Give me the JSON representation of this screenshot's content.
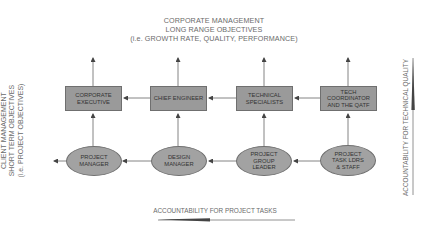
{
  "top": {
    "lines": [
      "CORPORATE MANAGEMENT",
      "LONG RANGE OBJECTIVES",
      "(i.e. GROWTH RATE, QUALITY, PERFORMANCE)"
    ]
  },
  "left": {
    "lines": [
      "CLIENT MANAGEMENT",
      "SHORT TERM OBJECTIVES",
      "(i.e. PROJECT OBJECTIVES)"
    ]
  },
  "right": {
    "label": "ACCOUNTABILITY FOR TECHNICAL QUALITY"
  },
  "bottom": {
    "label": "ACCOUNTABILITY FOR PROJECT TASKS"
  },
  "boxes": [
    {
      "label": "CORPORATE\nEXECUTIVE"
    },
    {
      "label": "CHIEF ENGINEER"
    },
    {
      "label": "TECHNICAL\nSPECIALISTS"
    },
    {
      "label": "TECH\nCOORDINATOR\nAND THE QATF"
    }
  ],
  "ellipses": [
    {
      "label": "PROJECT\nMANAGER"
    },
    {
      "label": "DESIGN\nMANAGER"
    },
    {
      "label": "PROJECT\nGROUP\nLEADER"
    },
    {
      "label": "PROJECT\nTASK LDRS\n& STAFF"
    }
  ],
  "colors": {
    "box_fill": "#9a9a9a",
    "ellipse_fill": "#a2a2a2",
    "line": "#555555",
    "text": "#6a6a6a"
  }
}
